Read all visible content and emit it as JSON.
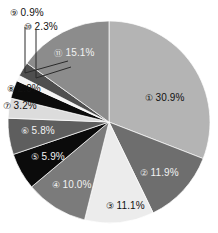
{
  "chart_data": {
    "type": "pie",
    "title": "",
    "subtitle": "",
    "xlabel": "",
    "ylabel": "",
    "legend_position": "none",
    "grid": false,
    "value_unit": "%",
    "start_angle_deg": 0,
    "direction": "clockwise",
    "categories": [
      "①",
      "②",
      "③",
      "④",
      "⑤",
      "⑥",
      "⑦",
      "⑧",
      "⑨",
      "⑩",
      "⑪"
    ],
    "values": [
      30.9,
      11.9,
      11.1,
      10.0,
      5.9,
      5.8,
      3.2,
      2.9,
      0.9,
      2.3,
      15.1
    ],
    "labels": [
      "① 30.9%",
      "② 11.9%",
      "③ 11.1%",
      "④ 10.0%",
      "⑤ 5.9%",
      "⑥ 5.8%",
      "⑦ 3.2%",
      "⑧ 2.9%",
      "⑨ 0.9%",
      "⑩ 2.3%",
      "⑪ 15.1%"
    ],
    "colors": [
      "#b4b4b4",
      "#6e6e6e",
      "#ececec",
      "#7b7b7b",
      "#0b0b0b",
      "#5e5e5e",
      "#dcdcdc",
      "#0b0b0b",
      "#f4f4f4",
      "#4f4f4f",
      "#8c8c8c"
    ]
  },
  "slices": [
    {
      "id": "slice-1",
      "marker": "①",
      "pct": "30.9%",
      "value": 30.9,
      "color": "#b4b4b4",
      "label_tone": "dark"
    },
    {
      "id": "slice-2",
      "marker": "②",
      "pct": "11.9%",
      "value": 11.9,
      "color": "#6e6e6e",
      "label_tone": "light"
    },
    {
      "id": "slice-3",
      "marker": "③",
      "pct": "11.1%",
      "value": 11.1,
      "color": "#ececec",
      "label_tone": "dark"
    },
    {
      "id": "slice-4",
      "marker": "④",
      "pct": "10.0%",
      "value": 10.0,
      "color": "#7b7b7b",
      "label_tone": "light"
    },
    {
      "id": "slice-5",
      "marker": "⑤",
      "pct": "5.9%",
      "value": 5.9,
      "color": "#0b0b0b",
      "label_tone": "light"
    },
    {
      "id": "slice-6",
      "marker": "⑥",
      "pct": "5.8%",
      "value": 5.8,
      "color": "#5e5e5e",
      "label_tone": "light"
    },
    {
      "id": "slice-7",
      "marker": "⑦",
      "pct": "3.2%",
      "value": 3.2,
      "color": "#dcdcdc",
      "label_tone": "dark"
    },
    {
      "id": "slice-8",
      "marker": "⑧",
      "pct": "2.9%",
      "value": 2.9,
      "color": "#0b0b0b",
      "label_tone": "dark"
    },
    {
      "id": "slice-9",
      "marker": "⑨",
      "pct": "0.9%",
      "value": 0.9,
      "color": "#f4f4f4",
      "label_tone": "dark"
    },
    {
      "id": "slice-10",
      "marker": "⑩",
      "pct": "2.3%",
      "value": 2.3,
      "color": "#4f4f4f",
      "label_tone": "dark"
    },
    {
      "id": "slice-11",
      "marker": "⑪",
      "pct": "15.1%",
      "value": 15.1,
      "color": "#8c8c8c",
      "label_tone": "light"
    }
  ],
  "style": {
    "background": "#ffffff",
    "slice_border": "#ffffff",
    "leader_line_color": "#2a2a2a"
  }
}
